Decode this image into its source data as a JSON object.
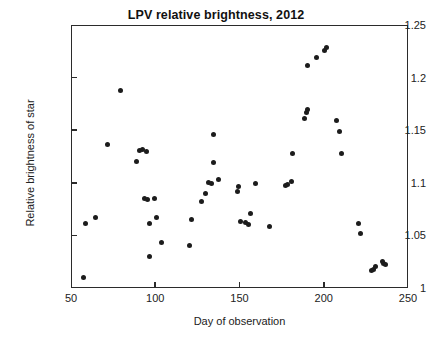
{
  "chart_data": {
    "type": "scatter",
    "title": "LPV relative brightness, 2012",
    "xlabel": "Day of observation",
    "ylabel": "Relative brightness of star",
    "xlim": [
      50,
      250
    ],
    "ylim": [
      1,
      1.25
    ],
    "xticks": [
      50,
      100,
      150,
      200,
      250
    ],
    "xtick_labels": [
      "50",
      "100",
      "150",
      "200",
      "250"
    ],
    "yticks": [
      1,
      1.05,
      1.1,
      1.15,
      1.2,
      1.25
    ],
    "ytick_labels": [
      "1",
      "1.05",
      "1.1",
      "1.15",
      "1.2",
      "1.25"
    ],
    "grid": false,
    "legend": false,
    "marker": "filled-circle",
    "marker_color": "#1c1c1c",
    "points": [
      {
        "x": 57,
        "y": 1.011
      },
      {
        "x": 58,
        "y": 1.062
      },
      {
        "x": 64,
        "y": 1.068
      },
      {
        "x": 71,
        "y": 1.137
      },
      {
        "x": 79,
        "y": 1.189
      },
      {
        "x": 88,
        "y": 1.121
      },
      {
        "x": 90,
        "y": 1.132
      },
      {
        "x": 92,
        "y": 1.133
      },
      {
        "x": 94,
        "y": 1.131
      },
      {
        "x": 93,
        "y": 1.086
      },
      {
        "x": 95,
        "y": 1.085
      },
      {
        "x": 96,
        "y": 1.062
      },
      {
        "x": 96,
        "y": 1.031
      },
      {
        "x": 99,
        "y": 1.086
      },
      {
        "x": 100,
        "y": 1.068
      },
      {
        "x": 103,
        "y": 1.044
      },
      {
        "x": 120,
        "y": 1.041
      },
      {
        "x": 121,
        "y": 1.066
      },
      {
        "x": 127,
        "y": 1.083
      },
      {
        "x": 129,
        "y": 1.091
      },
      {
        "x": 131,
        "y": 1.101
      },
      {
        "x": 133,
        "y": 1.1
      },
      {
        "x": 134,
        "y": 1.147
      },
      {
        "x": 134,
        "y": 1.12
      },
      {
        "x": 137,
        "y": 1.104
      },
      {
        "x": 148,
        "y": 1.093
      },
      {
        "x": 149,
        "y": 1.097
      },
      {
        "x": 150,
        "y": 1.064
      },
      {
        "x": 153,
        "y": 1.063
      },
      {
        "x": 155,
        "y": 1.061
      },
      {
        "x": 156,
        "y": 1.072
      },
      {
        "x": 159,
        "y": 1.1
      },
      {
        "x": 167,
        "y": 1.059
      },
      {
        "x": 177,
        "y": 1.098
      },
      {
        "x": 178,
        "y": 1.099
      },
      {
        "x": 180,
        "y": 1.102
      },
      {
        "x": 181,
        "y": 1.129
      },
      {
        "x": 188,
        "y": 1.162
      },
      {
        "x": 189,
        "y": 1.168
      },
      {
        "x": 190,
        "y": 1.171
      },
      {
        "x": 190,
        "y": 1.212
      },
      {
        "x": 195,
        "y": 1.22
      },
      {
        "x": 200,
        "y": 1.227
      },
      {
        "x": 201,
        "y": 1.23
      },
      {
        "x": 207,
        "y": 1.16
      },
      {
        "x": 209,
        "y": 1.15
      },
      {
        "x": 210,
        "y": 1.129
      },
      {
        "x": 220,
        "y": 1.062
      },
      {
        "x": 221,
        "y": 1.053
      },
      {
        "x": 228,
        "y": 1.018
      },
      {
        "x": 229,
        "y": 1.019
      },
      {
        "x": 230,
        "y": 1.021
      },
      {
        "x": 234,
        "y": 1.026
      },
      {
        "x": 235,
        "y": 1.024
      },
      {
        "x": 236,
        "y": 1.023
      }
    ]
  }
}
